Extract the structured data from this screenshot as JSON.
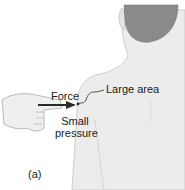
{
  "figure": {
    "panel_label": "(a)",
    "labels": {
      "force": "Force",
      "large_area": "Large area",
      "small_pressure_line1": "Small",
      "small_pressure_line2": "pressure"
    },
    "colors": {
      "skin": "#ececec",
      "skin_outline": "#b8b8b8",
      "hair": "#8a8a8a",
      "arrow": "#2a2a2a",
      "text": "#1a1a1a",
      "background": "#ffffff"
    }
  }
}
